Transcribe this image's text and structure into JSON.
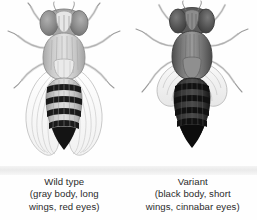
{
  "figure": {
    "background_color": "#fefefe",
    "specimens": [
      {
        "name": "wild-type",
        "title": "Wild type",
        "detail_line1": "(gray body, long",
        "detail_line2": "wings, red eyes)",
        "body_color": "#b9b9b9",
        "eye_color": "#8e8e8e",
        "wing_length": "long",
        "wing_color": "#fbfbfb",
        "abdomen_band_color": "#1a1a1a",
        "abdomen_tip_color": "#141414"
      },
      {
        "name": "variant",
        "title": "Variant",
        "detail_line1": "(black body, short",
        "detail_line2": "wings, cinnabar eyes)",
        "body_color": "#6f6f6f",
        "eye_color": "#4a4a4a",
        "wing_length": "short",
        "wing_color": "#f2f2f2",
        "abdomen_band_color": "#111111",
        "abdomen_tip_color": "#0c0c0c"
      }
    ]
  }
}
